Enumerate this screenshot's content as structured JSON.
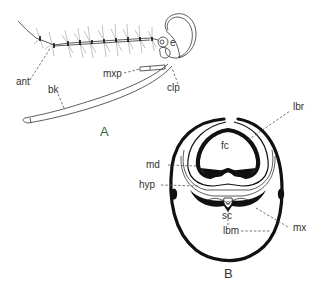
{
  "figure": {
    "panels": [
      {
        "id": "A",
        "label": "A",
        "label_color": "#2f6b3a",
        "description": "lateral view of head with antenna and proboscis",
        "callouts": {
          "ant": "ant",
          "e": "e",
          "mxp": "mxp",
          "clp": "clp",
          "bk": "bk"
        }
      },
      {
        "id": "B",
        "label": "B",
        "label_color": "#333333",
        "description": "cross-section of proboscis",
        "callouts": {
          "lbr": "lbr",
          "fc": "fc",
          "md": "md",
          "hyp": "hyp",
          "sc": "sc",
          "mx": "mx",
          "lbm": "lbm"
        }
      }
    ],
    "colors": {
      "ink": "#111111",
      "label_text": "#333333",
      "background": "#ffffff",
      "accent_green": "#2f6b3a"
    }
  }
}
